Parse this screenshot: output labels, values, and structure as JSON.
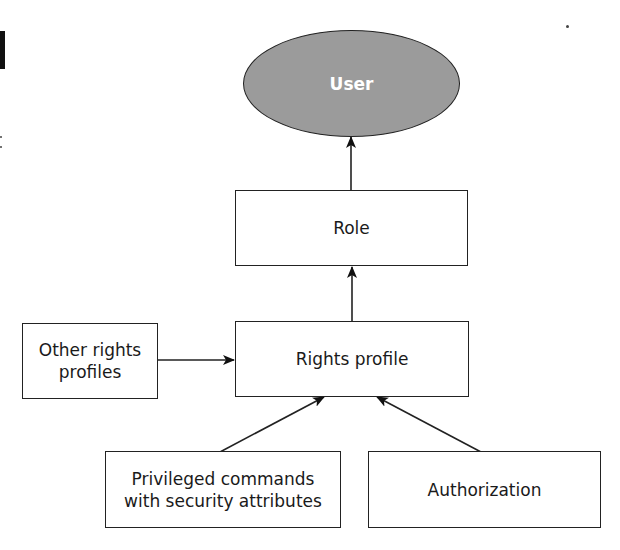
{
  "diagram": {
    "colors": {
      "user_fill": "#9b9b9b",
      "stroke": "#222222",
      "box_fill": "#ffffff",
      "user_text": "#ffffff"
    },
    "nodes": {
      "user": {
        "label": "User",
        "shape": "ellipse"
      },
      "role": {
        "label": "Role",
        "shape": "rectangle"
      },
      "rights_profile": {
        "label": "Rights profile",
        "shape": "rectangle"
      },
      "other_rights_profiles": {
        "label_line1": "Other rights",
        "label_line2": "profiles",
        "shape": "rectangle"
      },
      "privileged_commands": {
        "label_line1": "Privileged commands",
        "label_line2": "with security attributes",
        "shape": "rectangle"
      },
      "authorization": {
        "label": "Authorization",
        "shape": "rectangle"
      }
    },
    "edges": [
      {
        "from": "Role",
        "to": "User"
      },
      {
        "from": "Rights profile",
        "to": "Role"
      },
      {
        "from": "Other rights profiles",
        "to": "Rights profile"
      },
      {
        "from": "Privileged commands with security attributes",
        "to": "Rights profile"
      },
      {
        "from": "Authorization",
        "to": "Rights profile"
      }
    ]
  }
}
